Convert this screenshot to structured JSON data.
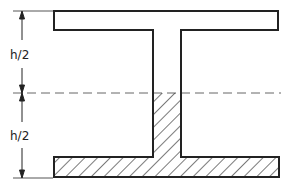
{
  "diagram": {
    "dimensions": {
      "upper_label": "h/2",
      "lower_label": "h/2"
    },
    "elements": {
      "top_flange": "unhatched",
      "web_upper": "unhatched",
      "web_lower": "hatched",
      "bottom_flange": "hatched",
      "neutral_axis": "dashed centerline"
    },
    "colors": {
      "line": "#222222",
      "hatch": "#333333",
      "dash": "#555555",
      "background": "#ffffff"
    }
  }
}
